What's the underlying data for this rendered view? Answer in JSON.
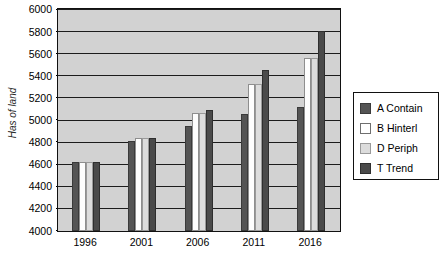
{
  "chart_data": {
    "type": "bar",
    "title": "",
    "subtitle": "",
    "xlabel": "",
    "ylabel": "Has of land",
    "categories": [
      "1996",
      "2001",
      "2006",
      "2011",
      "2016"
    ],
    "ylim": [
      4000,
      6000
    ],
    "yticks": [
      4000,
      4200,
      4400,
      4600,
      4800,
      5000,
      5200,
      5400,
      5600,
      5800,
      6000
    ],
    "ytick_labels": [
      "4000",
      "4200",
      "4400",
      "4600",
      "4800",
      "5000",
      "5200",
      "5400",
      "5600",
      "5800",
      "6000"
    ],
    "grid": true,
    "grid_axis": "y",
    "legend_position": "right",
    "series": [
      {
        "name": "A Contain",
        "color": "#545454",
        "values": [
          4620,
          4810,
          4950,
          5060,
          5120
        ]
      },
      {
        "name": "B Hinterl",
        "color": "#ffffff",
        "values": [
          4620,
          4840,
          5070,
          5330,
          5560
        ]
      },
      {
        "name": "D Periph",
        "color": "#dcdcdc",
        "values": [
          4620,
          4840,
          5070,
          5330,
          5560
        ]
      },
      {
        "name": "T Trend",
        "color": "#4a4a4a",
        "values": [
          4620,
          4845,
          5090,
          5460,
          5810
        ]
      }
    ]
  },
  "legend": {
    "items": [
      {
        "label": "A Contain",
        "swatch": "legend-swatch-a-contain"
      },
      {
        "label": "B Hinterl",
        "swatch": "legend-swatch-b-hinterl"
      },
      {
        "label": "D Periph",
        "swatch": "legend-swatch-d-periph"
      },
      {
        "label": "T Trend",
        "swatch": "legend-swatch-t-trend"
      }
    ]
  },
  "colors": {
    "plot_background": "#d2d2d2",
    "axis_line": "#111111",
    "gridline": "#1c1c1c",
    "page_background": "#ffffff"
  }
}
